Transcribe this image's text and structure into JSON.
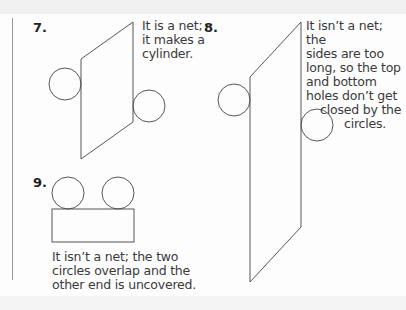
{
  "exercises": [
    {
      "number": "7.",
      "answer_lines": [
        "It is a net;",
        "it makes a",
        "cylinder."
      ]
    },
    {
      "number": "8.",
      "answer_lines": [
        "It isn’t a net; the",
        "sides are too",
        "long, so the top",
        "and bottom",
        "holes don’t get",
        "closed by the",
        "circles."
      ]
    },
    {
      "number": "9.",
      "answer_lines": [
        "It isn’t a net; the two",
        "circles overlap and the",
        "other end is uncovered."
      ]
    }
  ],
  "colors": {
    "line": "#444444",
    "text": "#3a3a3a",
    "background": "#fdfdfd"
  }
}
